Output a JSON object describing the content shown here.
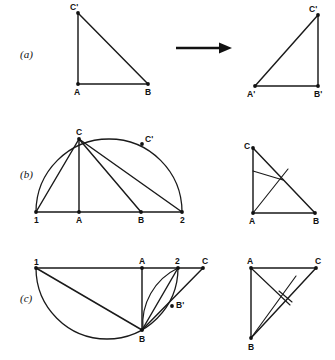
{
  "figure": {
    "width": 335,
    "height": 360,
    "background_color": "#ffffff",
    "ink_color": "#1a1a1a"
  },
  "panels": [
    {
      "id": "a",
      "label": "(a)",
      "label_x": 20,
      "label_y": 58,
      "description": "A right triangle ABC' is mapped by an arrow to its reflected copy A'B'C'.",
      "left_figure": {
        "name": "triangle-abc-prime",
        "points": [
          {
            "name": "C'",
            "x": 78,
            "y": 13,
            "label_dx": -8,
            "label_dy": -3
          },
          {
            "name": "A",
            "x": 78,
            "y": 84,
            "label_dx": -4,
            "label_dy": 11
          },
          {
            "name": "B",
            "x": 148,
            "y": 84,
            "label_dx": -3,
            "label_dy": 11
          }
        ],
        "edges": [
          [
            0,
            1
          ],
          [
            1,
            2
          ],
          [
            2,
            0
          ]
        ]
      },
      "arrow": {
        "name": "transform-arrow",
        "x1": 176,
        "y1": 48,
        "x2": 232,
        "y2": 48
      },
      "right_figure": {
        "name": "triangle-a-prime-b-prime-c-prime",
        "points": [
          {
            "name": "C'",
            "x": 318,
            "y": 15,
            "label_dx": -9,
            "label_dy": -3
          },
          {
            "name": "A'",
            "x": 255,
            "y": 86,
            "label_dx": -8,
            "label_dy": 11
          },
          {
            "name": "B'",
            "x": 318,
            "y": 86,
            "label_dx": -4,
            "label_dy": 11
          }
        ],
        "edges": [
          [
            0,
            1
          ],
          [
            1,
            2
          ],
          [
            2,
            0
          ]
        ]
      }
    },
    {
      "id": "b",
      "label": "(b)",
      "label_x": 20,
      "label_y": 178,
      "description": "Semicircle on diameter 1-2 with apex C; cevians from C to 1, A, B and 2. At right the resulting triangle CAB with its internal cevians.",
      "left_figure": {
        "name": "semicircle-construction-b",
        "semicircle": {
          "cx": 109,
          "cy": 212,
          "r": 73,
          "opens": "up"
        },
        "baseline": {
          "x1": 36,
          "y1": 212,
          "x2": 182,
          "y2": 212
        },
        "points": [
          {
            "name": "1",
            "x": 36,
            "y": 212,
            "label_dx": -2,
            "label_dy": 11
          },
          {
            "name": "A",
            "x": 79,
            "y": 212,
            "label_dx": -3,
            "label_dy": 11
          },
          {
            "name": "B",
            "x": 141,
            "y": 212,
            "label_dx": -3,
            "label_dy": 11
          },
          {
            "name": "2",
            "x": 182,
            "y": 212,
            "label_dx": -2,
            "label_dy": 11
          },
          {
            "name": "C",
            "x": 79,
            "y": 139,
            "label_dx": -3,
            "label_dy": -4
          },
          {
            "name": "C'",
            "x": 142,
            "y": 144,
            "label_dx": 3,
            "label_dy": -2
          }
        ],
        "cevians": [
          [
            4,
            0
          ],
          [
            4,
            1
          ],
          [
            4,
            2
          ],
          [
            4,
            3
          ]
        ]
      },
      "right_figure": {
        "name": "triangle-cab-with-cevians-b",
        "points": [
          {
            "name": "C",
            "x": 253,
            "y": 148,
            "label_dx": -9,
            "label_dy": 1
          },
          {
            "name": "A",
            "x": 253,
            "y": 213,
            "label_dx": -4,
            "label_dy": 11
          },
          {
            "name": "B",
            "x": 315,
            "y": 213,
            "label_dx": -2,
            "label_dy": 11
          }
        ],
        "edges": [
          [
            0,
            1
          ],
          [
            1,
            2
          ],
          [
            2,
            0
          ]
        ],
        "interior_segments": [
          {
            "name": "foot-segment",
            "x1": 253,
            "y1": 171,
            "x2": 283,
            "y2": 180
          },
          {
            "name": "cevian-a-to-hypotenuse",
            "x1": 253,
            "y1": 213,
            "x2": 288,
            "y2": 169
          }
        ]
      }
    },
    {
      "id": "c",
      "label": "(c)",
      "label_x": 20,
      "label_y": 302,
      "description": "Semicircle below the line 1-2 with apex B; segment B-C carries B'; an arc from 2 swings down to B. At right the resulting triangle ABC with internal cevians.",
      "left_figure": {
        "name": "semicircle-construction-c",
        "semicircle": {
          "cx": 107,
          "cy": 268,
          "r": 71,
          "opens": "down"
        },
        "baseline": {
          "x1": 36,
          "y1": 268,
          "x2": 203,
          "y2": 268
        },
        "points": [
          {
            "name": "1",
            "x": 36,
            "y": 268,
            "label_dx": -2,
            "label_dy": -3
          },
          {
            "name": "A",
            "x": 142,
            "y": 268,
            "label_dx": -3,
            "label_dy": -4
          },
          {
            "name": "2",
            "x": 178,
            "y": 268,
            "label_dx": -3,
            "label_dy": -4
          },
          {
            "name": "C",
            "x": 203,
            "y": 268,
            "label_dx": -1,
            "label_dy": -4
          },
          {
            "name": "B",
            "x": 142,
            "y": 330,
            "label_dx": -3,
            "label_dy": 12
          },
          {
            "name": "B'",
            "x": 172,
            "y": 306,
            "label_dx": 4,
            "label_dy": 2
          }
        ],
        "segments": [
          {
            "name": "one-to-b",
            "from": 0,
            "to": 4
          },
          {
            "name": "a-to-b",
            "from": 1,
            "to": 4
          },
          {
            "name": "two-to-b",
            "from": 2,
            "to": 4
          },
          {
            "name": "b-to-c",
            "from": 4,
            "to": 3
          }
        ],
        "swing_arc": {
          "name": "swing-arc-2-to-b",
          "x1": 178,
          "y1": 268,
          "x2": 143,
          "y2": 330,
          "rx": 62,
          "ry": 62
        }
      },
      "right_figure": {
        "name": "triangle-abc-with-cevians-c",
        "points": [
          {
            "name": "A",
            "x": 251,
            "y": 268,
            "label_dx": -4,
            "label_dy": -4
          },
          {
            "name": "C",
            "x": 316,
            "y": 268,
            "label_dx": -1,
            "label_dy": -4
          },
          {
            "name": "B",
            "x": 251,
            "y": 338,
            "label_dx": -3,
            "label_dy": 12
          }
        ],
        "edges": [
          [
            0,
            1
          ],
          [
            0,
            2
          ],
          [
            2,
            1
          ]
        ],
        "interior_segments": [
          {
            "name": "cevian-a-to-bc",
            "x1": 251,
            "y1": 268,
            "x2": 290,
            "y2": 305
          },
          {
            "name": "cevian-b-to-ac",
            "x1": 251,
            "y1": 338,
            "x2": 296,
            "y2": 276
          },
          {
            "name": "foot-segment",
            "x1": 279,
            "y1": 291,
            "x2": 292,
            "y2": 302
          }
        ]
      }
    }
  ]
}
